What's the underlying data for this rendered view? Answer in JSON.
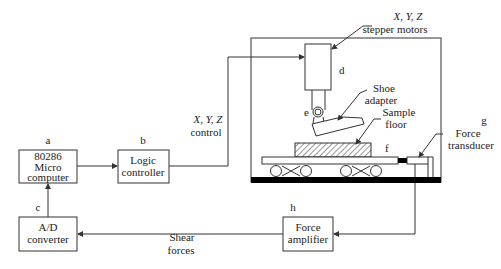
{
  "diagram": {
    "blocks": {
      "micro": {
        "tag": "a",
        "lines": [
          "80286",
          "Micro",
          "computer"
        ]
      },
      "logic": {
        "tag": "b",
        "lines": [
          "Logic",
          "controller"
        ]
      },
      "ad": {
        "tag": "c",
        "lines": [
          "A/D",
          "converter"
        ]
      },
      "amp": {
        "tag": "h",
        "lines": [
          "Force",
          "amplifier"
        ]
      }
    },
    "apparatus": {
      "motors": {
        "tag": "d",
        "lines": [
          "X, Y, Z",
          "stepper motors"
        ]
      },
      "shoe": {
        "tag": "e",
        "lines": [
          "Shoe",
          "adapter"
        ]
      },
      "floor": {
        "tag": "f",
        "lines": [
          "Sample",
          "floor"
        ]
      },
      "transducer": {
        "tag": "g",
        "lines": [
          "Force",
          "transducer"
        ]
      }
    },
    "signals": {
      "control": [
        "X, Y, Z",
        "control"
      ],
      "shear": [
        "Shear",
        "forces"
      ]
    },
    "colors": {
      "line": "#333333",
      "base": "#000000",
      "background": "#ffffff"
    }
  }
}
